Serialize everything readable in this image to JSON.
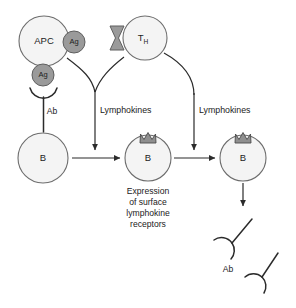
{
  "diagram": {
    "background_color": "#ffffff",
    "cell_fill": "#f4f4f4",
    "cell_stroke": "#6d6d6d",
    "antigen_fill": "#9a9a9a",
    "receptor_fill": "#9a9a9a",
    "line_color": "#2b2b2b",
    "cells": {
      "apc": {
        "label": "APC",
        "name": "antigen-presenting-cell"
      },
      "th": {
        "label": "T",
        "subscript": "H",
        "name": "helper-t-cell"
      },
      "b1": {
        "label": "B",
        "name": "b-cell-resting"
      },
      "b2": {
        "label": "B",
        "name": "b-cell-expressing-receptors"
      },
      "b3": {
        "label": "B",
        "name": "b-cell-secreting"
      }
    },
    "antigens": [
      {
        "label": "Ag",
        "name": "antigen-bound-apc"
      },
      {
        "label": "Ag",
        "name": "antigen-presented-to-b-cell"
      }
    ],
    "antibody_labels": [
      {
        "label": "Ab",
        "name": "antibody-on-b-cell"
      },
      {
        "label": "Ab",
        "name": "antibody-secreted"
      }
    ],
    "flow_labels": [
      {
        "label": "Lymphokines",
        "name": "lymphokines-left"
      },
      {
        "label": "Lymphokines",
        "name": "lymphokines-right"
      }
    ],
    "caption": {
      "lines": [
        "Expression",
        "of surface",
        "lymphokine",
        "receptors"
      ]
    }
  }
}
